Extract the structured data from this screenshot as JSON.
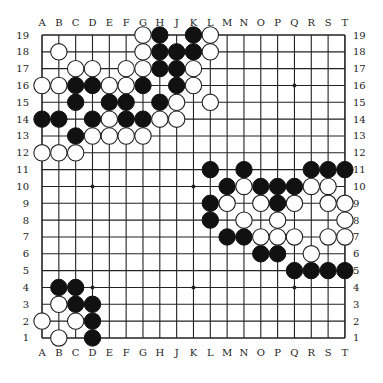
{
  "board": {
    "size": 19,
    "columns": [
      "A",
      "B",
      "C",
      "D",
      "E",
      "F",
      "G",
      "H",
      "J",
      "K",
      "L",
      "M",
      "N",
      "O",
      "P",
      "Q",
      "R",
      "S",
      "T"
    ],
    "rows": [
      19,
      18,
      17,
      16,
      15,
      14,
      13,
      12,
      11,
      10,
      9,
      8,
      7,
      6,
      5,
      4,
      3,
      2,
      1
    ],
    "hoshi": [
      "D4",
      "K4",
      "Q4",
      "D10",
      "K10",
      "Q10",
      "D16",
      "K16",
      "Q16"
    ],
    "colors": {
      "line": "#222222",
      "black": "#111111",
      "white": "#ffffff",
      "background": "#ffffff"
    }
  },
  "stones": {
    "black": [
      "H19",
      "K19",
      "H18",
      "J18",
      "K18",
      "H17",
      "J17",
      "C16",
      "D16",
      "G16",
      "J16",
      "C15",
      "E15",
      "F15",
      "H15",
      "A14",
      "B14",
      "D14",
      "F14",
      "G14",
      "C13",
      "L11",
      "N11",
      "R11",
      "S11",
      "T11",
      "M10",
      "O10",
      "P10",
      "Q10",
      "L9",
      "P9",
      "L8",
      "M7",
      "N7",
      "O6",
      "P6",
      "Q5",
      "R5",
      "S5",
      "T5",
      "B4",
      "C4",
      "C3",
      "D3",
      "D2",
      "D1"
    ],
    "white": [
      "G19",
      "L19",
      "B18",
      "G18",
      "L18",
      "C17",
      "D17",
      "F17",
      "G17",
      "K17",
      "A16",
      "B16",
      "E16",
      "F16",
      "K16",
      "J15",
      "L15",
      "E14",
      "H14",
      "J14",
      "D13",
      "E13",
      "F13",
      "G13",
      "A12",
      "B12",
      "C12",
      "N10",
      "R10",
      "S10",
      "M9",
      "O9",
      "Q9",
      "S9",
      "T9",
      "N8",
      "P8",
      "T8",
      "O7",
      "P7",
      "Q7",
      "S7",
      "T7",
      "R6",
      "B3",
      "A2",
      "C2",
      "B1"
    ]
  }
}
